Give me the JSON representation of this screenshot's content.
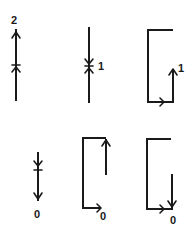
{
  "figure": {
    "line_color": "#1a1a1a",
    "background": "#ffffff"
  },
  "panels": [
    {
      "id": "top-left",
      "shape": "vertical-line",
      "direction": "up",
      "marker": "fixed-point-crossing",
      "label": "2",
      "label_position": "top"
    },
    {
      "id": "top-middle",
      "shape": "vertical-line",
      "direction": "converging",
      "marker": "stable-point",
      "label": "1",
      "label_position": "right-middle"
    },
    {
      "id": "top-right",
      "shape": "open-rectangle-loop",
      "direction": "right-then-up",
      "label": "1",
      "label_position": "right-end"
    },
    {
      "id": "bottom-left",
      "shape": "vertical-line",
      "direction": "down",
      "marker": "fixed-point-crossing",
      "label": "0",
      "label_position": "bottom"
    },
    {
      "id": "bottom-middle",
      "shape": "open-rectangle-loop",
      "direction": "right-then-up",
      "label": "0",
      "label_position": "bottom-right"
    },
    {
      "id": "bottom-right",
      "shape": "open-rectangle-loop",
      "direction": "right-then-down",
      "label": "0",
      "label_position": "bottom-right"
    }
  ],
  "labels": {
    "p1": "2",
    "p2": "1",
    "p3": "1",
    "p4": "0",
    "p5": "0",
    "p6": "0"
  }
}
